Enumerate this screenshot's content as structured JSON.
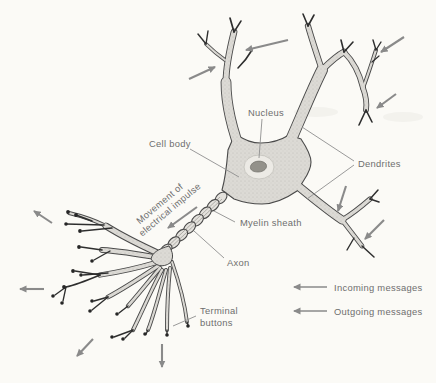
{
  "figure": {
    "type": "neuron-anatomy-diagram",
    "labels": {
      "nucleus": "Nucleus",
      "cell_body": "Cell body",
      "dendrites": "Dendrites",
      "myelin_sheath": "Myelin sheath",
      "axon": "Axon",
      "terminal_buttons_line1": "Terminal",
      "terminal_buttons_line2": "buttons",
      "impulse_line1": "Movement of",
      "impulse_line2": "electrical impulse"
    },
    "legend": {
      "incoming": "Incoming messages",
      "outgoing": "Outgoing messages"
    },
    "arrows": {
      "incoming_count": 6,
      "outgoing_count": 4,
      "impulse_direction": "from cell body along axon toward terminal buttons"
    },
    "colors": {
      "background": "#fbfaf6",
      "ink": "#3f3f3f",
      "cell_fill": "#dcdad5",
      "arrow": "#8a8a8a",
      "label_text": "#6e6e6e",
      "terminal_dot": "#262626"
    }
  }
}
